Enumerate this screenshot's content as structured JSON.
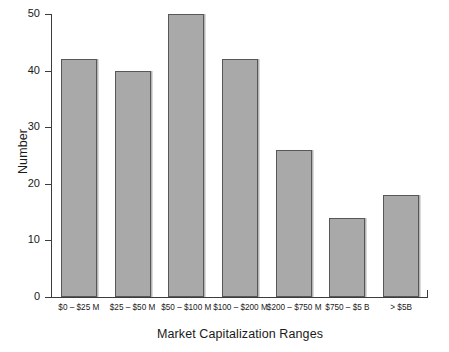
{
  "chart_data": {
    "type": "bar",
    "title": "",
    "xlabel": "Market Capitalization Ranges",
    "ylabel": "Number",
    "categories": [
      "$0 – $25 M",
      "$25 – $50 M",
      "$50 – $100 M",
      "$100 – $200 M",
      "$200 – $750 M",
      "$750 – $5 B",
      "> $5B"
    ],
    "values": [
      42,
      40,
      50,
      42,
      26,
      14,
      18
    ],
    "ylim": [
      0,
      50
    ],
    "yticks": [
      0,
      10,
      20,
      30,
      40,
      50
    ],
    "ytick_labels": [
      "0",
      "10",
      "20",
      "30",
      "40",
      "50"
    ],
    "grid": false,
    "legend": null,
    "bar_fill_color": "#a9a9a9",
    "bar_border_color": "#575757",
    "axis_color": "#3c3c3c",
    "background_color": "#ffffff"
  }
}
